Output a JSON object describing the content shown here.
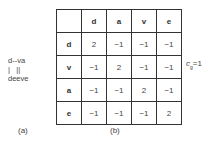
{
  "panel_a": {
    "alignment_lines": [
      "d--va",
      "|   ||",
      "deeve"
    ],
    "label": "(a)"
  },
  "panel_b": {
    "column_headers": [
      "",
      "d",
      "a",
      "v",
      "e"
    ],
    "rows": [
      {
        "header": "d",
        "values": [
          "2",
          "−1",
          "−1",
          "−1"
        ]
      },
      {
        "header": "v",
        "values": [
          "−1",
          "2",
          "−1",
          "−1"
        ]
      },
      {
        "header": "a",
        "values": [
          "−1",
          "−1",
          "2",
          "−1"
        ]
      },
      {
        "header": "e",
        "values": [
          "−1",
          "−1",
          "−1",
          "2"
        ]
      }
    ],
    "label": "(b)"
  },
  "gap_cost": {
    "symbol": "c",
    "subscript": "g",
    "equals": "=1"
  }
}
